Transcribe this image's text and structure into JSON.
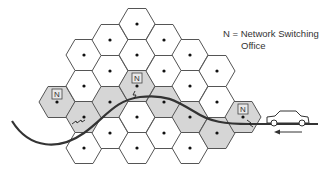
{
  "legend": {
    "line1": "N = Network Switching",
    "line2": "Office"
  },
  "network_office_label": "N",
  "colors": {
    "cell_fill": "#ffffff",
    "cell_shaded": "#d6d6d6",
    "cell_stroke": "#555555",
    "road": "#333333",
    "dot": "#111111"
  },
  "cells": [
    {
      "x": 57,
      "y": 102,
      "shaded": true,
      "office": true
    },
    {
      "x": 84,
      "y": 55,
      "shaded": false
    },
    {
      "x": 84,
      "y": 86,
      "shaded": false
    },
    {
      "x": 84,
      "y": 117,
      "shaded": true
    },
    {
      "x": 84,
      "y": 148,
      "shaded": false
    },
    {
      "x": 110,
      "y": 40,
      "shaded": false
    },
    {
      "x": 110,
      "y": 71,
      "shaded": false
    },
    {
      "x": 110,
      "y": 102,
      "shaded": true
    },
    {
      "x": 110,
      "y": 133,
      "shaded": false
    },
    {
      "x": 137,
      "y": 24,
      "shaded": false
    },
    {
      "x": 137,
      "y": 55,
      "shaded": false
    },
    {
      "x": 137,
      "y": 86,
      "shaded": true,
      "office": true
    },
    {
      "x": 137,
      "y": 117,
      "shaded": false
    },
    {
      "x": 137,
      "y": 148,
      "shaded": false
    },
    {
      "x": 164,
      "y": 40,
      "shaded": false
    },
    {
      "x": 164,
      "y": 71,
      "shaded": false
    },
    {
      "x": 164,
      "y": 102,
      "shaded": true
    },
    {
      "x": 164,
      "y": 133,
      "shaded": false
    },
    {
      "x": 190,
      "y": 55,
      "shaded": false
    },
    {
      "x": 190,
      "y": 86,
      "shaded": false
    },
    {
      "x": 190,
      "y": 117,
      "shaded": true
    },
    {
      "x": 190,
      "y": 148,
      "shaded": false
    },
    {
      "x": 217,
      "y": 71,
      "shaded": false
    },
    {
      "x": 217,
      "y": 102,
      "shaded": false
    },
    {
      "x": 217,
      "y": 133,
      "shaded": true
    },
    {
      "x": 243,
      "y": 117,
      "shaded": true,
      "office": true
    }
  ]
}
